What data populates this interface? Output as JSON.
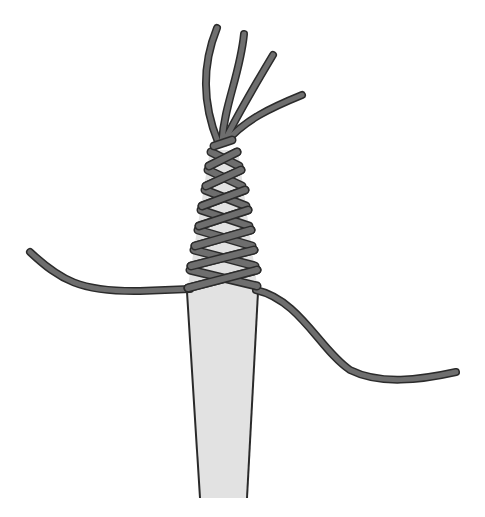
{
  "title": "Cord wrapping around a stick",
  "colors": {
    "background": "#ffffff",
    "stick_fill": "#e2e2e2",
    "stick_outline": "#2a2a2a",
    "cord_fill": "#6e6e6e",
    "cord_outline": "#2b2b2b"
  },
  "elements": {
    "stick": "tapered stick",
    "wrap": "crisscross cord wrapping",
    "loose_ends": "four loose cord strands at top",
    "left_cord": "cord extending to left",
    "right_cord": "cord extending to right"
  }
}
